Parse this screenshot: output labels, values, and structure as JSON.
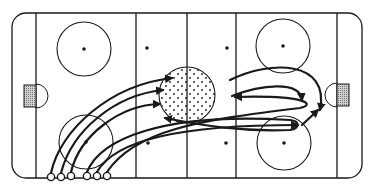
{
  "diagram": {
    "title": "Hockey rink drill diagram",
    "type": "hockey-rink-drill",
    "colors": {
      "ink": "#1a1a1a",
      "background": "#ffffff",
      "net_fill": "#9a9a9a"
    },
    "rink": {
      "x": 12,
      "y": 13,
      "width": 350,
      "height": 165,
      "corner_radius": 14,
      "goal_lines_x": [
        36,
        337
      ],
      "blue_lines_x": [
        136,
        236
      ],
      "center_line_x": 187
    },
    "faceoff_circles": [
      {
        "name": "top-left",
        "cx": 84,
        "cy": 49,
        "r": 27
      },
      {
        "name": "bottom-left",
        "cx": 86,
        "cy": 142,
        "r": 27
      },
      {
        "name": "top-right",
        "cx": 283,
        "cy": 46,
        "r": 27
      },
      {
        "name": "bottom-right",
        "cx": 284,
        "cy": 143,
        "r": 27
      }
    ],
    "center_circle": {
      "cx": 187,
      "cy": 95,
      "r": 28,
      "shaded": true
    },
    "neutral_dots": [
      {
        "cx": 147,
        "cy": 48
      },
      {
        "cx": 148,
        "cy": 143
      },
      {
        "cx": 227,
        "cy": 48
      },
      {
        "cx": 226,
        "cy": 143
      }
    ],
    "nets": [
      {
        "side": "left",
        "x": 24,
        "y": 85,
        "w": 12,
        "h": 22
      },
      {
        "side": "right",
        "x": 337,
        "y": 84,
        "w": 12,
        "h": 22
      }
    ],
    "players": [
      {
        "cx": 51,
        "cy": 177
      },
      {
        "cx": 61,
        "cy": 177
      },
      {
        "cx": 71,
        "cy": 176
      },
      {
        "cx": 87,
        "cy": 176
      },
      {
        "cx": 97,
        "cy": 176
      },
      {
        "cx": 107,
        "cy": 176
      }
    ],
    "paths": [
      {
        "d": "M51,173 C60,130 110,85 172,78"
      },
      {
        "d": "M61,173 C72,130 115,95 163,90"
      },
      {
        "d": "M71,172 C80,135 120,105 160,104"
      },
      {
        "d": "M87,172 C100,140 160,112 290,120 C300,121 300,128 290,130 C240,132 200,125 165,118"
      },
      {
        "d": "M97,172 C115,140 180,125 298,125"
      },
      {
        "d": "M107,172 C135,130 200,120 300,108 C315,105 310,95 235,97"
      },
      {
        "d": "M230,80 C270,60 330,60 320,110"
      },
      {
        "d": "M232,96 C260,85 300,80 302,100"
      },
      {
        "d": "M302,125 L318,110"
      }
    ]
  }
}
